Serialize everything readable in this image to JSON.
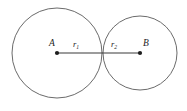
{
  "figure": {
    "kind": "geometry-diagram",
    "background_color": "#ffffff",
    "width": 187,
    "height": 111,
    "colors": {
      "circle_stroke": "#6b6b6b",
      "segment_stroke": "#3a3a3a",
      "point_fill": "#1d1d1d",
      "text_fill": "#1d1d1d"
    },
    "labels": {
      "center_a": "A",
      "center_b": "B",
      "radius_1": "r",
      "radius_1_subscript": "1",
      "radius_2": "r",
      "radius_2_subscript": "2"
    },
    "geometry": {
      "circle_a": {
        "cx": 57,
        "cy": 53,
        "r": 45
      },
      "circle_b": {
        "cx": 140,
        "cy": 53,
        "r": 37
      },
      "tangent_point_x": 102,
      "segment": {
        "x1": 57,
        "y1": 53,
        "x2": 140,
        "y2": 53
      },
      "dot_radius": 2.1,
      "label_positions": {
        "a": {
          "x": 52,
          "y": 46
        },
        "r1": {
          "x": 76,
          "y": 47
        },
        "r2": {
          "x": 114,
          "y": 47
        },
        "b": {
          "x": 146,
          "y": 46
        }
      }
    }
  }
}
